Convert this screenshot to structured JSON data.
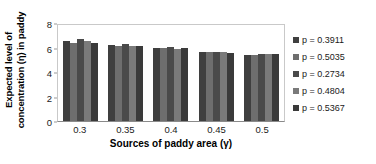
{
  "chart_data": {
    "type": "bar",
    "title": "",
    "xlabel": "Sources of paddy area (γ)",
    "ylabel": "Expected level of concentration (η) in paddy",
    "ylabel_line1": "Expected level of",
    "ylabel_line2": "concentration (η) in paddy",
    "categories": [
      "0.3",
      "0.35",
      "0.4",
      "0.45",
      "0.5"
    ],
    "yticks": [
      "0",
      "2",
      "4",
      "6",
      "8"
    ],
    "ylim": [
      0,
      8
    ],
    "grid": false,
    "legend_position": "right",
    "series": [
      {
        "name": "p = 0.3911",
        "color": "#3f3f3f",
        "values": [
          6.55,
          6.2,
          6.0,
          5.62,
          5.42
        ]
      },
      {
        "name": "p = 0.5035",
        "color": "#6e6e6e",
        "values": [
          6.4,
          6.1,
          5.95,
          5.6,
          5.4
        ]
      },
      {
        "name": "p = 0.2734",
        "color": "#4a4a4a",
        "values": [
          6.72,
          6.3,
          6.05,
          5.63,
          5.43
        ]
      },
      {
        "name": "p = 0.4804",
        "color": "#7a7a7a",
        "values": [
          6.5,
          6.15,
          5.9,
          5.6,
          5.45
        ]
      },
      {
        "name": "p = 0.5367",
        "color": "#3a3a3a",
        "values": [
          6.38,
          6.1,
          5.92,
          5.58,
          5.5
        ]
      }
    ]
  },
  "colors": {
    "axis": "#8a8a8a",
    "plot_border": "#c9c9c9",
    "text": "#1a1a1a",
    "background": "#ffffff"
  }
}
